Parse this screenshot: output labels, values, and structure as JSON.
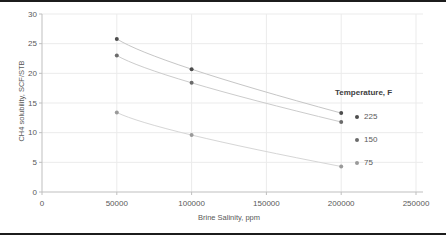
{
  "figure": {
    "frame_color": "#1c1c1c",
    "background": "#ffffff"
  },
  "chart_data": {
    "type": "scatter",
    "title": "",
    "xlabel": "Brine Salinity, ppm",
    "ylabel": "CH4 solubility, SCF/STB",
    "xlim": [
      0,
      250000
    ],
    "ylim": [
      0,
      30
    ],
    "x_ticks": [
      0,
      50000,
      100000,
      150000,
      200000,
      250000
    ],
    "x_tick_labels": [
      "0",
      "50000",
      "100000",
      "150000",
      "200000",
      "250000"
    ],
    "y_ticks": [
      0,
      5,
      10,
      15,
      20,
      25,
      30
    ],
    "y_tick_labels": [
      "0",
      "5",
      "10",
      "15",
      "20",
      "25",
      "30"
    ],
    "grid": true,
    "grid_color": "#ebebeb",
    "axis_color": "#bfbfbf",
    "text_color": "#595959",
    "legend_title": "Temperature, F",
    "legend_position": "right",
    "trendlines": true,
    "x": [
      50000,
      100000,
      200000
    ],
    "series": [
      {
        "name": "225",
        "values": [
          25.8,
          20.7,
          13.3
        ],
        "marker_color": "#4d4d4d",
        "line_color": "#c6c6c6"
      },
      {
        "name": "150",
        "values": [
          23.0,
          18.4,
          11.8
        ],
        "marker_color": "#6b6b6b",
        "line_color": "#cccccc"
      },
      {
        "name": "75",
        "values": [
          13.4,
          9.6,
          4.3
        ],
        "marker_color": "#9a9a9a",
        "line_color": "#d6d6d6"
      }
    ]
  }
}
